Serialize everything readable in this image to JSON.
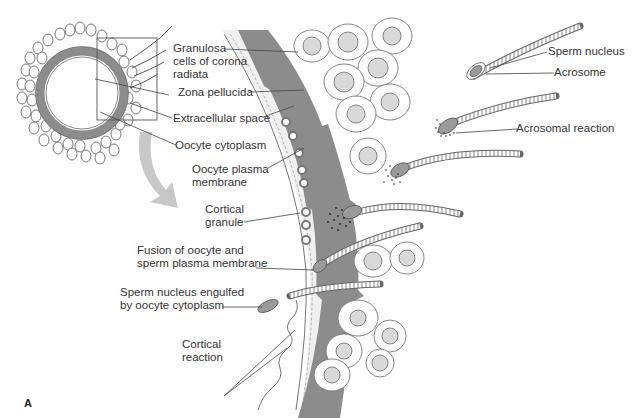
{
  "figure": {
    "panel_letter": "A",
    "colors": {
      "zona": "#8c8c8c",
      "cell_fill": "#ffffff",
      "nucleus_fill": "#d9d9d9",
      "line": "#555555",
      "arrow": "#c8c8c8",
      "extracellular": "#ececec"
    }
  },
  "labels": {
    "granulosa_1": "Granulosa",
    "granulosa_2": "cells of corona",
    "granulosa_3": "radiata",
    "zona_pellucida": "Zona pellucida",
    "extracellular_space": "Extracellular space",
    "oocyte_cytoplasm": "Oocyte cytoplasm",
    "oocyte_plasma_1": "Oocyte plasma",
    "oocyte_plasma_2": "membrane",
    "cortical_granule_1": "Cortical",
    "cortical_granule_2": "granule",
    "fusion_1": "Fusion of oocyte and",
    "fusion_2": "sperm plasma membrane",
    "engulfed_1": "Sperm nucleus engulfed",
    "engulfed_2": "by oocyte cytoplasm",
    "cortical_reaction_1": "Cortical",
    "cortical_reaction_2": "reaction",
    "sperm_nucleus": "Sperm nucleus",
    "acrosome": "Acrosome",
    "acrosomal_reaction": "Acrosomal reaction"
  }
}
